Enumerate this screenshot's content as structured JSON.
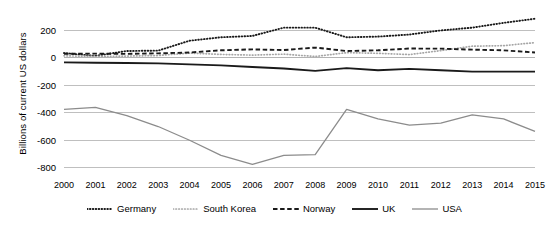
{
  "chart_data": {
    "type": "line",
    "title": "",
    "xlabel": "",
    "ylabel": "Billions of current US dollars",
    "x": [
      2000,
      2001,
      2002,
      2003,
      2004,
      2005,
      2006,
      2007,
      2008,
      2009,
      2010,
      2011,
      2012,
      2013,
      2014,
      2015
    ],
    "xtick_labels": [
      "2000",
      "2001",
      "2002",
      "2003",
      "2004",
      "2005",
      "2006",
      "2007",
      "2008",
      "2009",
      "2010",
      "2011",
      "2012",
      "2013",
      "2014",
      "2015"
    ],
    "ytick_labels": [
      "200",
      "0",
      "-200",
      "-400",
      "-600",
      "-800"
    ],
    "ytick_values": [
      200,
      0,
      -200,
      -400,
      -600,
      -800
    ],
    "ylim": [
      -880,
      300
    ],
    "xlim": [
      2000,
      2015
    ],
    "grid": true,
    "legend_position": "bottom",
    "series": [
      {
        "name": "Germany",
        "style": "dotted",
        "color": "#1a1a1a",
        "values": [
          30,
          10,
          45,
          48,
          120,
          145,
          155,
          215,
          215,
          145,
          150,
          165,
          195,
          215,
          250,
          280
        ]
      },
      {
        "name": "South Korea",
        "style": "dotted-light",
        "color": "#a6a6a6",
        "values": [
          10,
          5,
          8,
          12,
          30,
          20,
          15,
          22,
          5,
          33,
          28,
          19,
          48,
          80,
          84,
          106
        ]
      },
      {
        "name": "Norway",
        "style": "dashed",
        "color": "#1a1a1a",
        "values": [
          25,
          26,
          24,
          28,
          34,
          50,
          57,
          52,
          70,
          45,
          50,
          63,
          62,
          55,
          50,
          34
        ]
      },
      {
        "name": "UK",
        "style": "solid",
        "color": "#1a1a1a",
        "values": [
          -38,
          -40,
          -42,
          -45,
          -52,
          -60,
          -72,
          -82,
          -100,
          -80,
          -95,
          -85,
          -95,
          -105,
          -105,
          -105
        ]
      },
      {
        "name": "USA",
        "style": "solid-light",
        "color": "#8c8c8c",
        "values": [
          -380,
          -365,
          -425,
          -505,
          -605,
          -715,
          -780,
          -715,
          -710,
          -380,
          -450,
          -495,
          -480,
          -420,
          -450,
          -540
        ]
      }
    ]
  },
  "legend": {
    "items": [
      {
        "label": "Germany",
        "swatch": "dotted-dark-swatch"
      },
      {
        "label": "South Korea",
        "swatch": "dotted-light-swatch"
      },
      {
        "label": "Norway",
        "swatch": "dashed-dark-swatch"
      },
      {
        "label": "UK",
        "swatch": "solid-dark-swatch"
      },
      {
        "label": "USA",
        "swatch": "solid-light-swatch"
      }
    ]
  }
}
